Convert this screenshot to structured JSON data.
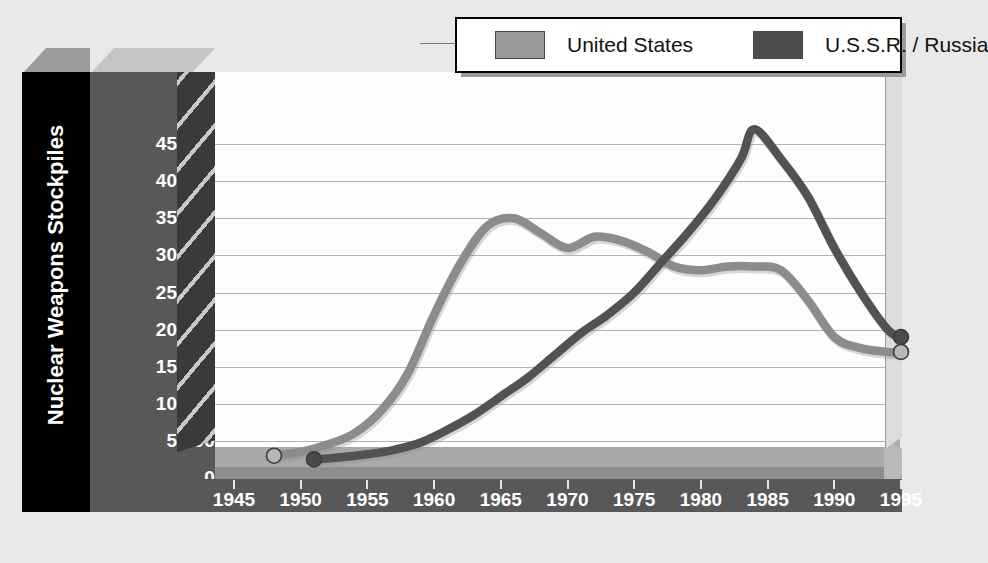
{
  "chart_data": {
    "type": "line",
    "title": "",
    "xlabel": "",
    "ylabel": "Nuclear Weapons Stockpiles",
    "xlim": [
      1945,
      1995
    ],
    "ylim": [
      0,
      48000
    ],
    "grid": true,
    "legend_position": "top-right",
    "x_ticks": [
      "1945",
      "1950",
      "1955",
      "1960",
      "1965",
      "1970",
      "1975",
      "1980",
      "1985",
      "1990",
      "1995"
    ],
    "y_ticks": [
      "0",
      "5,000",
      "10,000",
      "15,000",
      "20,000",
      "25,000",
      "30,000",
      "35,000",
      "40,000",
      "45,000"
    ],
    "series": [
      {
        "name": "United States",
        "color": "#8c8c8c",
        "x": [
          1948,
          1950,
          1952,
          1954,
          1956,
          1958,
          1960,
          1962,
          1964,
          1966,
          1968,
          1970,
          1972,
          1974,
          1976,
          1978,
          1980,
          1982,
          1984,
          1986,
          1988,
          1990,
          1992,
          1994,
          1995
        ],
        "values": [
          3000,
          3500,
          4500,
          6000,
          9000,
          14000,
          22000,
          29000,
          34000,
          35000,
          33000,
          31000,
          32500,
          32000,
          30500,
          28500,
          28000,
          28500,
          28500,
          28000,
          24000,
          19000,
          17500,
          17000,
          17000
        ]
      },
      {
        "name": "U.S.S.R. / Russia",
        "color": "#525252",
        "x": [
          1951,
          1953,
          1955,
          1957,
          1959,
          1961,
          1963,
          1965,
          1967,
          1969,
          1971,
          1973,
          1975,
          1977,
          1979,
          1981,
          1983,
          1984,
          1986,
          1988,
          1990,
          1992,
          1994,
          1995
        ],
        "values": [
          2500,
          2800,
          3200,
          3800,
          4800,
          6500,
          8500,
          11000,
          13500,
          16500,
          19500,
          22000,
          25000,
          29000,
          33000,
          37500,
          43000,
          47000,
          43000,
          38000,
          31000,
          25000,
          20000,
          19000
        ]
      }
    ],
    "markers": [
      {
        "series": "United States",
        "x": 1948,
        "y": 3000,
        "style": "open-circle"
      },
      {
        "series": "U.S.S.R. / Russia",
        "x": 1951,
        "y": 2500,
        "style": "filled-circle"
      },
      {
        "series": "U.S.S.R. / Russia",
        "x": 1995,
        "y": 19000,
        "style": "filled-circle"
      },
      {
        "series": "United States",
        "x": 1995,
        "y": 17000,
        "style": "open-circle"
      }
    ]
  },
  "legend": {
    "entries": [
      {
        "label": "United States",
        "color": "#9a9a9a"
      },
      {
        "label": "U.S.S.R.  / Russia",
        "color": "#4c4c4c"
      }
    ]
  },
  "axis": {
    "y_title": "Nuclear Weapons Stockpiles",
    "y_labels": [
      "45,000",
      "40,000",
      "35,000",
      "30,000",
      "25,000",
      "20,000",
      "15,000",
      "10,000",
      "5,000",
      "0"
    ],
    "x_labels": [
      "1945",
      "1950",
      "1955",
      "1960",
      "1965",
      "1970",
      "1975",
      "1980",
      "1985",
      "1990",
      "1995"
    ]
  },
  "colors": {
    "background": "#e9e9e9",
    "plot_wall": "#fdfdfd",
    "panel_dark": "#585858",
    "panel_black": "#000000",
    "gridline": "#b4b4b4",
    "us_line": "#8c8c8c",
    "ussr_line": "#525252"
  }
}
